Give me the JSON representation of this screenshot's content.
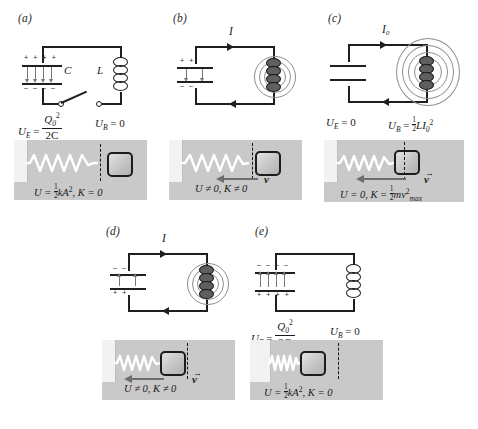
{
  "figure": {
    "accent_gray": "#c9c9c9",
    "line_color": "#1f1f1f",
    "field_line_color": "#8e8e8e"
  },
  "panels": [
    {
      "id": "a",
      "label": "(a)",
      "current_label": "",
      "capacitor": {
        "top_sign": "+ + + +",
        "bottom_sign": "– – – –",
        "label": "C",
        "field_direction": "down"
      },
      "inductor": {
        "label": "L",
        "energized": false
      },
      "switch": {
        "state": "open"
      },
      "energy_electric": {
        "symbol": "U",
        "sub": "E",
        "value_num": "Q",
        "value_num_sub": "0",
        "value_num_sup": "2",
        "value_den": "2C"
      },
      "energy_magnetic": {
        "symbol": "U",
        "sub": "B",
        "value": "0"
      },
      "spring": {
        "state": "stretched",
        "block_position": "right",
        "velocity": "none",
        "velocity_label": "",
        "caption_U": "U = ½kA²",
        "caption_K": "K = 0",
        "caption": "U = ½kA², K = 0"
      }
    },
    {
      "id": "b",
      "label": "(b)",
      "current_label": "I",
      "capacitor": {
        "top_sign": "+        +",
        "bottom_sign": "–        –",
        "label": "",
        "field_direction": "down"
      },
      "inductor": {
        "label": "",
        "energized": true
      },
      "switch": {
        "state": "closed"
      },
      "energy_electric": null,
      "energy_magnetic": null,
      "spring": {
        "state": "partly-relaxed",
        "block_position": "mid-right",
        "velocity": "left",
        "velocity_label": "v",
        "caption": "U ≠ 0, K ≠ 0"
      }
    },
    {
      "id": "c",
      "label": "(c)",
      "current_label": "I₀",
      "capacitor": {
        "top_sign": "",
        "bottom_sign": "",
        "label": "",
        "field_direction": "none"
      },
      "inductor": {
        "label": "",
        "energized": true
      },
      "switch": {
        "state": "closed"
      },
      "energy_electric": {
        "symbol": "U",
        "sub": "E",
        "value": "0"
      },
      "energy_magnetic": {
        "symbol": "U",
        "sub": "B",
        "value": "½LI₀²"
      },
      "spring": {
        "state": "relaxed",
        "block_position": "center",
        "velocity": "left",
        "velocity_label": "v",
        "caption": "U = 0, K = ½mv²max"
      }
    },
    {
      "id": "d",
      "label": "(d)",
      "current_label": "I",
      "capacitor": {
        "top_sign": "–        –",
        "bottom_sign": "+        +",
        "label": "",
        "field_direction": "up"
      },
      "inductor": {
        "label": "",
        "energized": true
      },
      "switch": {
        "state": "closed"
      },
      "energy_electric": null,
      "energy_magnetic": null,
      "spring": {
        "state": "compressed-partly",
        "block_position": "mid-left",
        "velocity": "left",
        "velocity_label": "v",
        "caption": "U ≠ 0, K ≠ 0"
      }
    },
    {
      "id": "e",
      "label": "(e)",
      "current_label": "",
      "capacitor": {
        "top_sign": "– – – –",
        "bottom_sign": "+ + + +",
        "label": "",
        "field_direction": "up"
      },
      "inductor": {
        "label": "",
        "energized": false
      },
      "switch": {
        "state": "closed"
      },
      "energy_electric": {
        "symbol": "U",
        "sub": "E",
        "value_num": "Q",
        "value_num_sub": "0",
        "value_num_sup": "2",
        "value_den": "2C"
      },
      "energy_magnetic": {
        "symbol": "U",
        "sub": "B",
        "value": "0"
      },
      "spring": {
        "state": "compressed",
        "block_position": "left",
        "velocity": "none",
        "velocity_label": "",
        "caption": "U = ½kA², K = 0"
      }
    }
  ],
  "symbols": {
    "U": "U",
    "K": "K",
    "Q": "Q",
    "C": "C",
    "L": "L",
    "I": "I",
    "A": "A",
    "k": "k",
    "m": "m",
    "v": "v",
    "equals": "=",
    "not_equal": "≠",
    "zero": "0",
    "two": "2",
    "max": "max",
    "sub_E": "E",
    "sub_B": "B",
    "sub_0": "0"
  }
}
